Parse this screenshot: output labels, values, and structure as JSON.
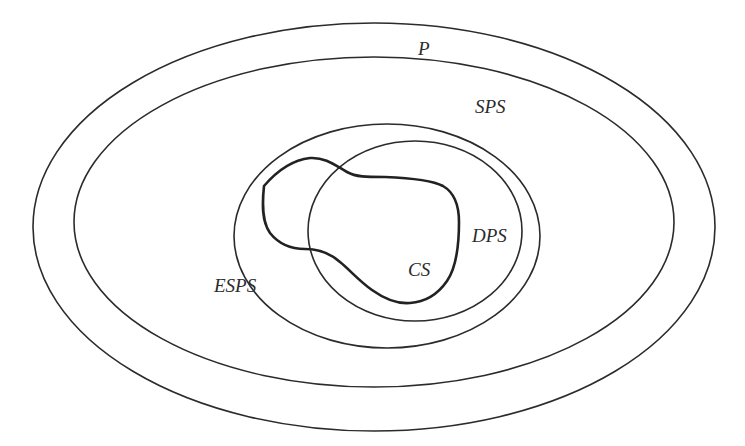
{
  "diagram": {
    "type": "nested-set-diagram",
    "line_color": "#2b2b2b",
    "background": "#ffffff",
    "sets": [
      {
        "id": "P",
        "label": "P",
        "shape": "ellipse",
        "cx": 374,
        "cy": 227,
        "rx": 341,
        "ry": 204,
        "label_x": 418,
        "label_y": 55
      },
      {
        "id": "SPS",
        "label": "SPS",
        "shape": "ellipse",
        "cx": 374,
        "cy": 222,
        "rx": 300,
        "ry": 165,
        "label_x": 475,
        "label_y": 113
      },
      {
        "id": "ESPS",
        "label": "ESPS",
        "shape": "ellipse",
        "cx": 387,
        "cy": 236,
        "rx": 153,
        "ry": 112,
        "label_x": 214,
        "label_y": 292
      },
      {
        "id": "DPS",
        "label": "DPS",
        "shape": "ellipse",
        "cx": 415,
        "cy": 231,
        "rx": 107,
        "ry": 90,
        "label_x": 472,
        "label_y": 242
      },
      {
        "id": "CS",
        "label": "CS",
        "shape": "blob",
        "label_x": 408,
        "label_y": 276
      }
    ],
    "relations": [
      "SPS is inside P",
      "ESPS is inside SPS",
      "DPS is inside ESPS",
      "CS is inside ESPS and overlaps DPS"
    ]
  }
}
